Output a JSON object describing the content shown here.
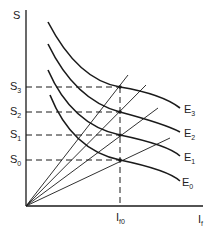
{
  "axes": {
    "y_label": "S",
    "x_label_main": "I",
    "x_label_sub": "f"
  },
  "y_ticks": [
    {
      "main": "S",
      "sub": "3",
      "y": 87
    },
    {
      "main": "S",
      "sub": "2",
      "y": 112
    },
    {
      "main": "S",
      "sub": "1",
      "y": 135
    },
    {
      "main": "S",
      "sub": "0",
      "y": 160
    }
  ],
  "x_tick": {
    "main": "I",
    "sub": "f0",
    "x": 120
  },
  "curves": [
    {
      "main": "E",
      "sub": "3"
    },
    {
      "main": "E",
      "sub": "2"
    },
    {
      "main": "E",
      "sub": "1"
    },
    {
      "main": "E",
      "sub": "0"
    }
  ],
  "colors": {
    "line": "#1a1a1a",
    "background": "#ffffff"
  }
}
